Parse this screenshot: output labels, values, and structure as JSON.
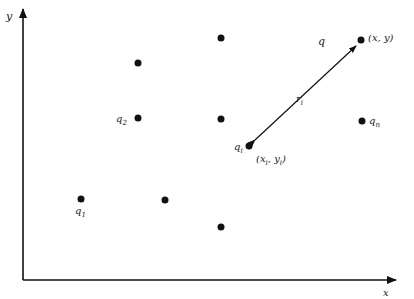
{
  "diagram": {
    "axes": {
      "x_label": "x",
      "y_label": "y",
      "origin": [
        23,
        280
      ],
      "x_end": [
        396,
        280
      ],
      "y_end": [
        23,
        8
      ]
    },
    "points": [
      {
        "id": "q",
        "x": 361,
        "y": 40,
        "label": "q",
        "coord_label": "(x, y)"
      },
      {
        "id": "qi",
        "x": 249,
        "y": 146,
        "label": "qi",
        "coord_label": "(xi, yi)"
      },
      {
        "id": "q1",
        "x": 81,
        "y": 199,
        "label": "q1"
      },
      {
        "id": "q2",
        "x": 138,
        "y": 118,
        "label": "q2"
      },
      {
        "id": "qn",
        "x": 362,
        "y": 121,
        "label": "qn"
      },
      {
        "id": "p_a",
        "x": 221,
        "y": 38,
        "label": ""
      },
      {
        "id": "p_b",
        "x": 138,
        "y": 63,
        "label": ""
      },
      {
        "id": "p_c",
        "x": 221,
        "y": 119,
        "label": ""
      },
      {
        "id": "p_d",
        "x": 165,
        "y": 200,
        "label": ""
      },
      {
        "id": "p_e",
        "x": 221,
        "y": 227,
        "label": ""
      }
    ],
    "distance": {
      "from": "q",
      "to": "qi",
      "label": "ri",
      "double_arrow": true
    },
    "colors": {
      "ink": "#111111",
      "background": "#ffffff"
    }
  }
}
